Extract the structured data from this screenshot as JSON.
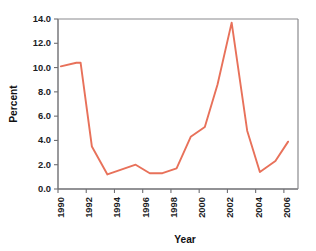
{
  "chart_data": {
    "type": "line",
    "title": "",
    "subtitle": "",
    "xlabel": "Year",
    "ylabel": "Percent",
    "xlim": [
      1990,
      2007
    ],
    "ylim": [
      0.0,
      14.0
    ],
    "grid": false,
    "legend": false,
    "legend_position": "none",
    "x_tick_labels": [
      "1990",
      "1992",
      "1994",
      "1996",
      "1998",
      "2000",
      "2002",
      "2004",
      "2006"
    ],
    "x_tick_values": [
      1990,
      1992,
      1994,
      1996,
      1998,
      2000,
      2002,
      2004,
      2006
    ],
    "y_tick_labels": [
      "0.0",
      "2.0",
      "4.0",
      "6.0",
      "8.0",
      "10.0",
      "12.0",
      "14.0"
    ],
    "y_tick_values": [
      0.0,
      2.0,
      4.0,
      6.0,
      8.0,
      10.0,
      12.0,
      14.0
    ],
    "series": [
      {
        "name": "Percent",
        "color": "#E8715A",
        "x": [
          1990.2,
          1991.3,
          1991.6,
          1992.4,
          1993.5,
          1995.5,
          1996.5,
          1997.4,
          1998.4,
          1999.4,
          2000.4,
          2001.3,
          2002.3,
          2003.4,
          2004.3,
          2005.4,
          2006.3
        ],
        "values": [
          10.1,
          10.4,
          10.4,
          3.5,
          1.2,
          2.0,
          1.3,
          1.3,
          1.7,
          4.3,
          5.1,
          8.6,
          13.7,
          4.8,
          1.4,
          2.3,
          3.9
        ]
      }
    ],
    "annotations": []
  },
  "axes": {
    "y_axis_title": "Percent",
    "x_axis_title": "Year"
  },
  "style": {
    "line_color": "#E8715A",
    "axis_color": "#6e6e72",
    "frame_color": "#8a8a8e",
    "text_color": "#1d1d1f",
    "background": "#ffffff"
  }
}
